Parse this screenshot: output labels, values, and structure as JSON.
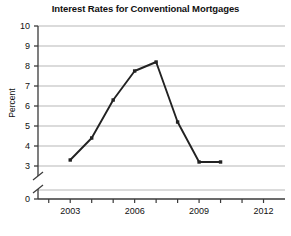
{
  "chart_data": {
    "type": "line",
    "title": "Interest Rates for Conventional Mortgages",
    "xlabel": "",
    "ylabel": "Percent",
    "x": [
      2003,
      2004,
      2005,
      2006,
      2007,
      2008,
      2009,
      2010
    ],
    "values": [
      3.3,
      4.4,
      6.3,
      7.75,
      8.2,
      5.2,
      3.2,
      3.2
    ],
    "series": [
      {
        "name": "Interest Rate",
        "values": [
          3.3,
          4.4,
          6.3,
          7.75,
          8.2,
          5.2,
          3.2,
          3.2
        ]
      }
    ],
    "xlim": [
      2001.5,
      2013.0
    ],
    "ylim": [
      3,
      10
    ],
    "y_axis_break": true,
    "y_zero_shown": true,
    "ytick_labels": [
      "0",
      "3",
      "4",
      "5",
      "6",
      "7",
      "8",
      "9",
      "10"
    ],
    "ytick_values": [
      0,
      3,
      4,
      5,
      6,
      7,
      8,
      9,
      10
    ],
    "xtick_labels": [
      "2003",
      "2006",
      "2009",
      "2012"
    ],
    "xtick_values": [
      2003,
      2006,
      2009,
      2012
    ],
    "xtick_minor_values": [
      2002,
      2004,
      2005,
      2007,
      2008,
      2010,
      2011
    ],
    "grid": "horizontal",
    "legend": "none",
    "line_color": "#222222",
    "grid_color": "#b8b8b8",
    "axis_color": "#3a3a3a",
    "marker": "square"
  }
}
